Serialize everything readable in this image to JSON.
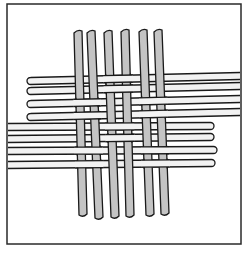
{
  "illustration": {
    "subject": "basket-weave",
    "description": "Line drawing of a 2x2 basket weave: six gray vertical strips (three pairs) interlaced with eight white horizontal strips (four pairs) inside a square frame",
    "colors": {
      "background": "#ffffff",
      "outline": "#1a1a1a",
      "vertical_fill": "#c4c4c4",
      "horizontal_fill": "#f2f2f2",
      "frame": "#2a2a2a"
    },
    "frame": {
      "x": 7,
      "y": 4,
      "w": 234,
      "h": 240
    },
    "vertical_strips": [
      {
        "x_top": 78,
        "y_top": 31,
        "x_bot": 83,
        "y_bot": 215,
        "w": 8
      },
      {
        "x_top": 91,
        "y_top": 31,
        "x_bot": 99,
        "y_bot": 218,
        "w": 8
      },
      {
        "x_top": 108,
        "y_top": 31,
        "x_bot": 115,
        "y_bot": 217,
        "w": 8
      },
      {
        "x_top": 125,
        "y_top": 30,
        "x_bot": 130,
        "y_bot": 216,
        "w": 8
      },
      {
        "x_top": 143,
        "y_top": 30,
        "x_bot": 150,
        "y_bot": 215,
        "w": 8
      },
      {
        "x_top": 158,
        "y_top": 30,
        "x_bot": 165,
        "y_bot": 214,
        "w": 8
      }
    ],
    "horizontal_strips": [
      {
        "x_left": 27,
        "y_left": 81,
        "x_right": 240,
        "y_right": 76,
        "h": 7,
        "cap": "left"
      },
      {
        "x_left": 27,
        "y_left": 91,
        "x_right": 240,
        "y_right": 86,
        "h": 7,
        "cap": "left"
      },
      {
        "x_left": 27,
        "y_left": 104,
        "x_right": 240,
        "y_right": 99,
        "h": 7,
        "cap": "left"
      },
      {
        "x_left": 27,
        "y_left": 117,
        "x_right": 240,
        "y_right": 112,
        "h": 7,
        "cap": "left"
      },
      {
        "x_left": 8,
        "y_left": 127,
        "x_right": 214,
        "y_right": 126,
        "h": 7,
        "cap": "right"
      },
      {
        "x_left": 8,
        "y_left": 139,
        "x_right": 214,
        "y_right": 137,
        "h": 7,
        "cap": "right"
      },
      {
        "x_left": 8,
        "y_left": 151,
        "x_right": 217,
        "y_right": 150,
        "h": 7,
        "cap": "right"
      },
      {
        "x_left": 8,
        "y_left": 165,
        "x_right": 215,
        "y_right": 163,
        "h": 7,
        "cap": "right"
      }
    ],
    "weave_pattern": {
      "type": "basket-2x2",
      "note": "over[h_pair][v_pair] = true when horizontal pair lies over vertical pair",
      "over": [
        [
          false,
          true,
          false
        ],
        [
          true,
          false,
          true
        ],
        [
          false,
          true,
          false
        ],
        [
          true,
          false,
          true
        ]
      ]
    }
  }
}
